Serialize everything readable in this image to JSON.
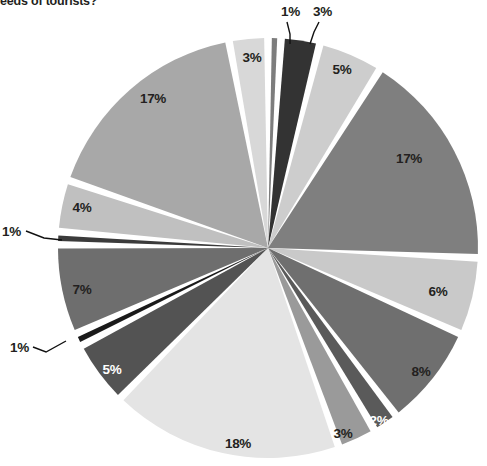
{
  "question": {
    "text": "eeds of tourists?"
  },
  "chart_data": {
    "type": "pie",
    "title": "",
    "xlabel": "",
    "ylabel": "",
    "legend": "none",
    "grid": false,
    "start_angle_deg": -90,
    "direction": "clockwise",
    "gap_deg": 2.1,
    "center": {
      "cx": 268,
      "cy": 248,
      "r": 210
    },
    "categories": [
      "slice-1",
      "slice-2",
      "slice-3",
      "slice-4",
      "slice-5",
      "slice-6",
      "slice-7",
      "slice-8",
      "slice-9",
      "slice-10",
      "slice-11",
      "slice-12",
      "slice-13",
      "slice-14",
      "slice-15",
      "slice-16"
    ],
    "values": [
      1,
      3,
      5,
      17,
      6,
      8,
      2,
      3,
      18,
      5,
      1,
      7,
      1,
      4,
      17,
      3
    ],
    "labels": [
      "1%",
      "3%",
      "5%",
      "17%",
      "6%",
      "8%",
      "2%",
      "3%",
      "18%",
      "5%",
      "1%",
      "7%",
      "1%",
      "4%",
      "17%",
      "3%"
    ],
    "colors": [
      "#7d7d7d",
      "#333333",
      "#cdcdcd",
      "#7f7f7f",
      "#c9c9c9",
      "#6f6f6f",
      "#5a5a5a",
      "#9a9a9a",
      "#e4e4e4",
      "#535353",
      "#1a1a1a",
      "#6e6e6e",
      "#3b3b3b",
      "#c0c0c0",
      "#a8a8a8",
      "#d8d8d8"
    ],
    "label_colors": [
      "#231f20",
      "#231f20",
      "#231f20",
      "#231f20",
      "#231f20",
      "#231f20",
      "#ffffff",
      "#231f20",
      "#231f20",
      "#ffffff",
      "#231f20",
      "#231f20",
      "#231f20",
      "#231f20",
      "#231f20",
      "#231f20"
    ],
    "callouts": [
      {
        "label": "1%",
        "text_x": 281,
        "text_y": 16,
        "path": "M 287 22 L 290 34 L 290 44"
      },
      {
        "label": "3%",
        "text_x": 313,
        "text_y": 16,
        "path": "M 319 22 L 314 32 L 310 44"
      },
      {
        "label": "1%",
        "text_x": 2,
        "text_y": 236,
        "path": "M 26 231 L 44 238 L 62 240"
      },
      {
        "label": "1%",
        "text_x": 10,
        "text_y": 352,
        "path": "M 33 347 L 46 352 L 66 341"
      }
    ],
    "slice_label_positions": [
      {
        "x": 0,
        "y": 0,
        "inside": false
      },
      {
        "x": 0,
        "y": 0,
        "inside": false
      },
      {
        "x": 342,
        "y": 74,
        "inside": true
      },
      {
        "x": 409,
        "y": 163,
        "inside": true
      },
      {
        "x": 438,
        "y": 296,
        "inside": true
      },
      {
        "x": 421,
        "y": 376,
        "inside": true
      },
      {
        "x": 379,
        "y": 425,
        "inside": true
      },
      {
        "x": 343,
        "y": 438,
        "inside": true
      },
      {
        "x": 238,
        "y": 448,
        "inside": true
      },
      {
        "x": 112,
        "y": 374,
        "inside": true
      },
      {
        "x": 0,
        "y": 0,
        "inside": false
      },
      {
        "x": 82,
        "y": 294,
        "inside": true
      },
      {
        "x": 0,
        "y": 0,
        "inside": false
      },
      {
        "x": 82,
        "y": 212,
        "inside": true
      },
      {
        "x": 153,
        "y": 103,
        "inside": true
      },
      {
        "x": 252,
        "y": 62,
        "inside": true
      }
    ]
  }
}
